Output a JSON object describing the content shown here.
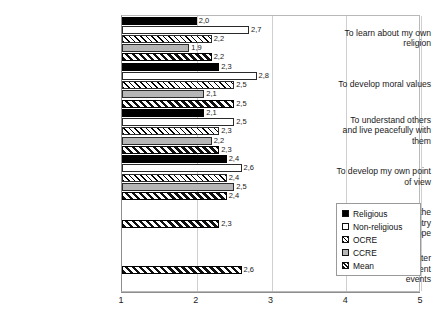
{
  "title_strip": {
    "clipped_text": "· ·      ·  ·                            · ·      ·   ·"
  },
  "legend": {
    "position": "inside-right-lower",
    "items": [
      {
        "label": "Religious",
        "swatch": "solid-black-swatch"
      },
      {
        "label": "Non-religious",
        "swatch": "white-swatch"
      },
      {
        "label": "OCRE",
        "swatch": "light-hatch-swatch"
      },
      {
        "label": "CCRE",
        "swatch": "gray-swatch"
      },
      {
        "label": "Mean",
        "swatch": "diagonal-hatch-swatch"
      }
    ]
  },
  "chart_data": {
    "type": "bar",
    "orientation": "horizontal",
    "title": "",
    "xlabel": "",
    "ylabel": "",
    "xlim": [
      1,
      5
    ],
    "xticks": [
      "1",
      "2",
      "3",
      "4",
      "5"
    ],
    "grid": true,
    "legend_position": "inside right",
    "categories": [
      "To learn about my own religion",
      "To develop moral values",
      "To understand others and live peacefully with them",
      "To develop my own point of view",
      "To understand the history of my country and of Europe",
      "To gain a better understanding of current events"
    ],
    "category_lines": [
      [
        "To learn about my own",
        "religion"
      ],
      [
        "To develop moral values"
      ],
      [
        "To understand others",
        "and live peacefully with",
        "them"
      ],
      [
        "To develop my own point",
        "of view"
      ],
      [
        "To understand the",
        "history of my country",
        "and of Europe"
      ],
      [
        "To gain a better",
        "understanding of current",
        "events"
      ]
    ],
    "series": [
      {
        "name": "Religious",
        "values": [
          2.0,
          2.3,
          2.1,
          2.4,
          null,
          null
        ]
      },
      {
        "name": "Non-religious",
        "values": [
          2.7,
          2.8,
          2.5,
          2.6,
          null,
          null
        ]
      },
      {
        "name": "OCRE",
        "values": [
          2.2,
          2.5,
          2.3,
          2.4,
          null,
          null
        ]
      },
      {
        "name": "CCRE",
        "values": [
          1.9,
          2.1,
          2.2,
          2.5,
          null,
          null
        ]
      },
      {
        "name": "Mean",
        "values": [
          2.2,
          2.5,
          2.3,
          2.4,
          2.3,
          2.6
        ]
      }
    ],
    "data_labels": [
      [
        "2,0",
        "2,7",
        "2,2",
        "1,9",
        "2,2"
      ],
      [
        "2,3",
        "2,8",
        "2,5",
        "2,1",
        "2,5"
      ],
      [
        "2,1",
        "2,5",
        "2,3",
        "2,2",
        "2,3"
      ],
      [
        "2,4",
        "2,6",
        "2,4",
        "2,5",
        "2,4"
      ],
      [
        null,
        null,
        null,
        null,
        "2,3"
      ],
      [
        null,
        null,
        null,
        null,
        "2,6"
      ]
    ]
  }
}
